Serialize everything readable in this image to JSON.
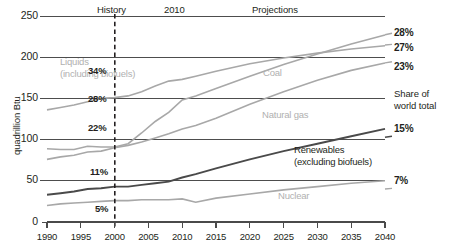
{
  "chart_data": {
    "type": "line",
    "title": "",
    "xlabel": "",
    "ylabel": "quadrillion Btu",
    "xlim": [
      1990,
      2040
    ],
    "ylim": [
      0,
      250
    ],
    "xticks": [
      "1990",
      "1995",
      "2000",
      "2005",
      "2010",
      "2015",
      "2020",
      "2025",
      "2030",
      "2035",
      "2040"
    ],
    "yticks": [
      "0",
      "50",
      "100",
      "150",
      "200",
      "250"
    ],
    "grid": true,
    "legend_position": "inline-labels",
    "history_projection_split": 2010,
    "annotations": {
      "history_label": "History",
      "split_year_label": "2010",
      "projections_label": "Projections",
      "share_note_line1": "Share of",
      "share_note_line2": "world total"
    },
    "series": [
      {
        "name": "Liquids (including biofuels)",
        "label_line1": "Liquids",
        "label_line2": "(including biofuels)",
        "color": "#a8a8a8",
        "share_2010": "34%",
        "share_2040": "27%",
        "x": [
          1990,
          1992,
          1994,
          1996,
          1998,
          2000,
          2002,
          2004,
          2006,
          2008,
          2010,
          2012,
          2015,
          2020,
          2025,
          2030,
          2035,
          2040
        ],
        "y": [
          136,
          139,
          142,
          146,
          150,
          151,
          153,
          158,
          165,
          171,
          173,
          177,
          183,
          192,
          199,
          205,
          210,
          214
        ]
      },
      {
        "name": "Coal",
        "label_line1": "Coal",
        "color": "#a8a8a8",
        "share_2010": "28%",
        "share_2040": "28%",
        "x": [
          1990,
          1992,
          1994,
          1996,
          1998,
          2000,
          2002,
          2004,
          2006,
          2008,
          2010,
          2012,
          2015,
          2020,
          2025,
          2030,
          2035,
          2040
        ],
        "y": [
          89,
          88,
          88,
          92,
          91,
          91,
          95,
          108,
          122,
          133,
          148,
          153,
          162,
          177,
          191,
          204,
          216,
          227
        ]
      },
      {
        "name": "Natural gas",
        "label_line1": "Natural gas",
        "color": "#a8a8a8",
        "share_2010": "22%",
        "share_2040": "23%",
        "x": [
          1990,
          1992,
          1994,
          1996,
          1998,
          2000,
          2002,
          2004,
          2006,
          2008,
          2010,
          2012,
          2015,
          2020,
          2025,
          2030,
          2035,
          2040
        ],
        "y": [
          76,
          79,
          81,
          85,
          86,
          90,
          93,
          97,
          102,
          107,
          113,
          117,
          126,
          143,
          158,
          172,
          184,
          193
        ]
      },
      {
        "name": "Renewables (excluding biofuels)",
        "label_line1": "Renewables",
        "label_line2": "(excluding biofuels)",
        "color": "#4a4a4a",
        "share_2010": "11%",
        "share_2040": "15%",
        "x": [
          1990,
          1992,
          1994,
          1996,
          1998,
          2000,
          2002,
          2004,
          2006,
          2008,
          2010,
          2012,
          2015,
          2020,
          2025,
          2030,
          2035,
          2040
        ],
        "y": [
          33,
          35,
          37,
          40,
          41,
          43,
          43,
          45,
          47,
          49,
          54,
          58,
          65,
          76,
          86,
          95,
          104,
          113
        ]
      },
      {
        "name": "Nuclear",
        "label_line1": "Nuclear",
        "color": "#a8a8a8",
        "share_2010": "5%",
        "share_2040": "7%",
        "x": [
          1990,
          1992,
          1994,
          1996,
          1998,
          2000,
          2002,
          2004,
          2006,
          2008,
          2010,
          2012,
          2015,
          2020,
          2025,
          2030,
          2035,
          2040
        ],
        "y": [
          20,
          22,
          23,
          24,
          25,
          26,
          26,
          27,
          27,
          27,
          28,
          24,
          29,
          34,
          39,
          43,
          47,
          50
        ]
      }
    ],
    "right_labels": [
      "28%",
      "27%",
      "23%",
      "15%",
      "7%"
    ],
    "inner_labels_2010": [
      "34%",
      "28%",
      "22%",
      "11%",
      "5%"
    ]
  }
}
